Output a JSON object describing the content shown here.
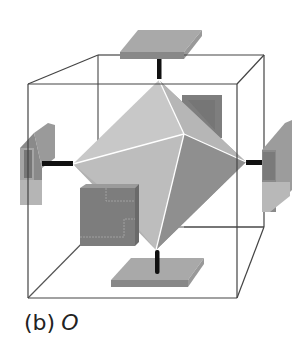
{
  "figure": {
    "caption_label": "(b)",
    "caption_symbol": "O",
    "colors": {
      "cube_edge": "#444444",
      "octahedron_light": "#c4c4c4",
      "octahedron_mid": "#b0b0b0",
      "octahedron_dark": "#8e8e8e",
      "octahedron_edge": "#ffffff",
      "plate_top": "#a8a8a8",
      "plate_side": "#8a8a8a",
      "block_face": "#7a7a7a",
      "rod": "#111111"
    }
  }
}
